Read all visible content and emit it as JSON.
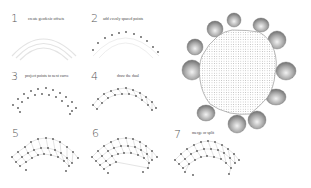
{
  "steps": [
    {
      "number": "1",
      "label": "create geodesic offsets"
    },
    {
      "number": "2",
      "label": "add evenly spaced points"
    },
    {
      "number": "3",
      "label": "project points to next curve"
    },
    {
      "number": "4",
      "label": "draw the dual"
    },
    {
      "number": "5",
      "label": ""
    },
    {
      "number": "6",
      "label": ""
    },
    {
      "number": "7",
      "label": "merge or split"
    }
  ],
  "colors": {
    "arc": "#e4e4e4",
    "point": "#555555",
    "line": "#bbbbbb",
    "mesh": "#8a8a8a",
    "mesh_dark": "#6e6e6e"
  }
}
